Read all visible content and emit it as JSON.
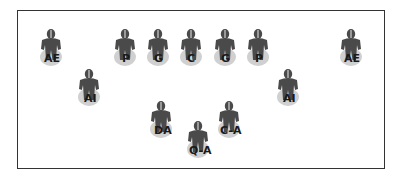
{
  "diagram": {
    "type": "football-formation",
    "colors": {
      "figure": "#4a4a4a",
      "shadow": "#d0d0d0",
      "border": "#333333"
    },
    "players": [
      {
        "label": "AE",
        "x": 36,
        "y": 28,
        "lx": 8
      },
      {
        "label": "P",
        "x": 110,
        "y": 28,
        "lx": 12
      },
      {
        "label": "G",
        "x": 143,
        "y": 28,
        "lx": 11
      },
      {
        "label": "C",
        "x": 176,
        "y": 28,
        "lx": 11
      },
      {
        "label": "G",
        "x": 210,
        "y": 28,
        "lx": 11
      },
      {
        "label": "P",
        "x": 243,
        "y": 28,
        "lx": 12
      },
      {
        "label": "AE",
        "x": 336,
        "y": 28,
        "lx": 8
      },
      {
        "label": "AI",
        "x": 74,
        "y": 68,
        "lx": 10
      },
      {
        "label": "AI",
        "x": 273,
        "y": 68,
        "lx": 10
      },
      {
        "label": "DA",
        "x": 146,
        "y": 100,
        "lx": 8
      },
      {
        "label": "C-A",
        "x": 214,
        "y": 100,
        "lx": 6
      },
      {
        "label": "Q-A",
        "x": 183,
        "y": 120,
        "lx": 6
      }
    ]
  }
}
